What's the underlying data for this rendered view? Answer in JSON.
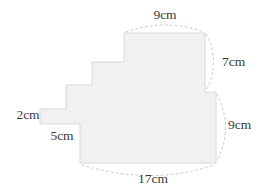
{
  "figure": {
    "kind": "composite-rectilinear-shape",
    "shape": {
      "fill_color": "#f1f1f1",
      "stroke_color": "#d8d8d8",
      "points": "124,33 205,33 205,92 216,92 216,163 80,163 80,124 40,124 40,109 66,109 66,85 92,85 92,62 124,62"
    },
    "leader_color": "#c9c9c9",
    "labels": [
      {
        "id": "top-9cm",
        "text": "9cm",
        "x": 165,
        "y": 16,
        "anchor": "middle"
      },
      {
        "id": "right-7cm",
        "text": "7cm",
        "x": 222,
        "y": 63,
        "anchor": "start"
      },
      {
        "id": "right-9cm",
        "text": "9cm",
        "x": 228,
        "y": 126,
        "anchor": "start"
      },
      {
        "id": "bottom-17cm",
        "text": "17cm",
        "x": 153,
        "y": 180,
        "anchor": "middle"
      },
      {
        "id": "left-2cm",
        "text": "2cm",
        "x": 28,
        "y": 116,
        "anchor": "middle"
      },
      {
        "id": "bottom-5cm",
        "text": "5cm",
        "x": 62,
        "y": 137,
        "anchor": "middle"
      }
    ],
    "arcs": [
      {
        "id": "arc-top-9cm",
        "d": "M 126,32 Q 165,18 204,32"
      },
      {
        "id": "arc-right-7cm",
        "d": "M 206,34 Q 221,62 206,91"
      },
      {
        "id": "arc-right-9cm",
        "d": "M 217,94 Q 234,127 217,161"
      },
      {
        "id": "arc-bottom-17cm",
        "d": "M 82,165 Q 152,186 214,165"
      }
    ]
  }
}
